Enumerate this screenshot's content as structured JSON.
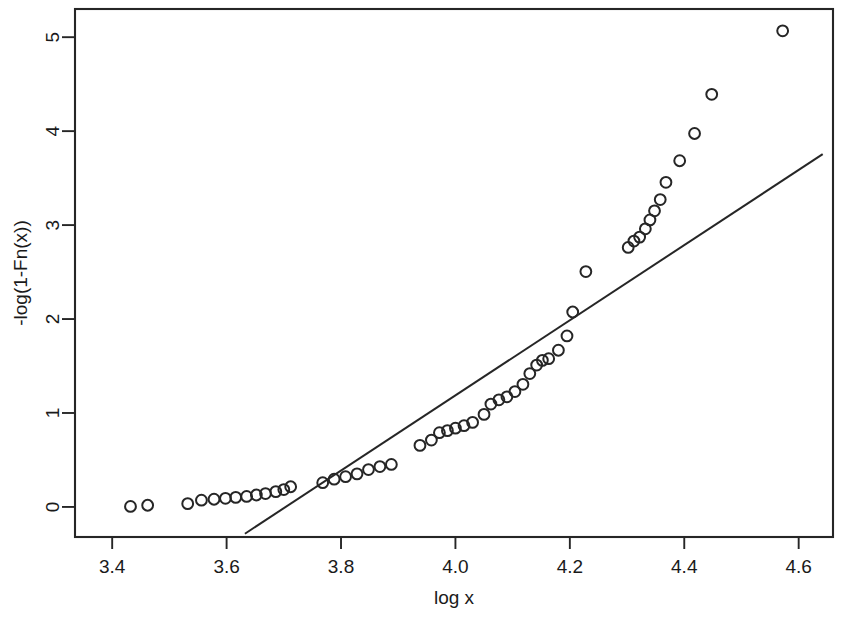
{
  "chart_data": {
    "type": "scatter",
    "title": "",
    "subtitle": "",
    "xlabel": "log x",
    "ylabel": "-log(1-Fn(x))",
    "xlim": [
      3.335,
      4.66
    ],
    "ylim": [
      -0.32,
      5.3
    ],
    "xticks": [
      3.4,
      3.6,
      3.8,
      4.0,
      4.2,
      4.4,
      4.6
    ],
    "xtick_labels": [
      "3.4",
      "3.6",
      "3.8",
      "4.0",
      "4.2",
      "4.4",
      "4.6"
    ],
    "yticks": [
      0,
      1,
      2,
      3,
      4,
      5
    ],
    "ytick_labels": [
      "0",
      "1",
      "2",
      "3",
      "4",
      "5"
    ],
    "grid": false,
    "legend": null,
    "marker": "open-circle",
    "marker_color": "#262626",
    "line_color": "#262626",
    "series": [
      {
        "name": "empirical exceedance",
        "type": "scatter",
        "points": [
          [
            3.432,
            0.005
          ],
          [
            3.462,
            0.018
          ],
          [
            3.532,
            0.035
          ],
          [
            3.556,
            0.072
          ],
          [
            3.578,
            0.082
          ],
          [
            3.598,
            0.092
          ],
          [
            3.616,
            0.102
          ],
          [
            3.635,
            0.112
          ],
          [
            3.652,
            0.127
          ],
          [
            3.668,
            0.142
          ],
          [
            3.686,
            0.163
          ],
          [
            3.7,
            0.185
          ],
          [
            3.712,
            0.215
          ],
          [
            3.768,
            0.258
          ],
          [
            3.788,
            0.295
          ],
          [
            3.808,
            0.322
          ],
          [
            3.828,
            0.352
          ],
          [
            3.848,
            0.398
          ],
          [
            3.868,
            0.43
          ],
          [
            3.888,
            0.452
          ],
          [
            3.938,
            0.655
          ],
          [
            3.958,
            0.712
          ],
          [
            3.972,
            0.79
          ],
          [
            3.986,
            0.812
          ],
          [
            4.0,
            0.838
          ],
          [
            4.015,
            0.865
          ],
          [
            4.03,
            0.9
          ],
          [
            4.05,
            0.985
          ],
          [
            4.062,
            1.095
          ],
          [
            4.076,
            1.14
          ],
          [
            4.09,
            1.172
          ],
          [
            4.104,
            1.228
          ],
          [
            4.118,
            1.305
          ],
          [
            4.13,
            1.42
          ],
          [
            4.142,
            1.51
          ],
          [
            4.152,
            1.56
          ],
          [
            4.163,
            1.578
          ],
          [
            4.18,
            1.668
          ],
          [
            4.195,
            1.82
          ],
          [
            4.205,
            2.075
          ],
          [
            4.228,
            2.505
          ],
          [
            4.302,
            2.762
          ],
          [
            4.312,
            2.83
          ],
          [
            4.322,
            2.872
          ],
          [
            4.332,
            2.96
          ],
          [
            4.34,
            3.055
          ],
          [
            4.348,
            3.152
          ],
          [
            4.358,
            3.272
          ],
          [
            4.368,
            3.455
          ],
          [
            4.392,
            3.685
          ],
          [
            4.418,
            3.975
          ],
          [
            4.448,
            4.392
          ],
          [
            4.572,
            5.068
          ]
        ]
      },
      {
        "name": "fitted line",
        "type": "line",
        "endpoints": [
          [
            3.632,
            -0.285
          ],
          [
            4.642,
            3.755
          ]
        ]
      }
    ]
  },
  "axis": {
    "x_title": "log x",
    "y_title": "-log(1-Fn(x))"
  }
}
